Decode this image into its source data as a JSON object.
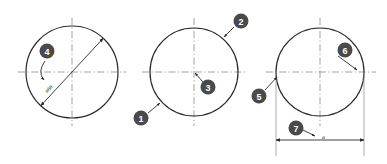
{
  "drawing": {
    "title": "Circle dimensioning callout diagram",
    "background_color": "#ffffff",
    "outline_color": "#2b2b2b",
    "centerline_color": "#8a8a8a",
    "dimension_color": "#3a3a3a",
    "callout_fill_color": "#4a4a4a",
    "callout_text_color": "#ffffff"
  },
  "circles": [
    {
      "id": "left-circle",
      "name": "circle-left",
      "cx": 72,
      "cy": 72,
      "r": 46
    },
    {
      "id": "middle-circle",
      "name": "circle-middle",
      "cx": 194,
      "cy": 72,
      "r": 44
    },
    {
      "id": "right-circle",
      "name": "circle-right",
      "cx": 320,
      "cy": 72,
      "r": 44
    }
  ],
  "dimensions": {
    "left_diameter_label": "⌀66",
    "right_diameter_label": "⌀"
  },
  "callouts": [
    {
      "number": "1",
      "cx": 141,
      "cy": 118,
      "label": "callout-1"
    },
    {
      "number": "2",
      "cx": 241,
      "cy": 21,
      "label": "callout-2"
    },
    {
      "number": "3",
      "cx": 208,
      "cy": 87,
      "label": "callout-3"
    },
    {
      "number": "4",
      "cx": 47,
      "cy": 51,
      "label": "callout-4"
    },
    {
      "number": "5",
      "cx": 259,
      "cy": 96,
      "label": "callout-5"
    },
    {
      "number": "6",
      "cx": 345,
      "cy": 50,
      "label": "callout-6"
    },
    {
      "number": "7",
      "cx": 296,
      "cy": 128,
      "label": "callout-7"
    }
  ]
}
